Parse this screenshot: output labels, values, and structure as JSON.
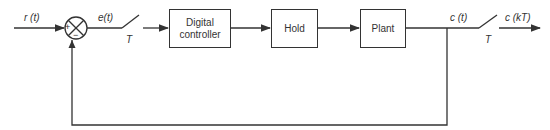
{
  "diagram": {
    "blocks": [
      {
        "id": "controller",
        "line1": "Digital",
        "line2": "controller"
      },
      {
        "id": "hold",
        "label": "Hold"
      },
      {
        "id": "plant",
        "label": "Plant"
      }
    ],
    "signals": {
      "input": "r (t)",
      "error": "e(t)",
      "output": "c (t)",
      "sampled_output": "c (kT)"
    },
    "samplers": {
      "error_sampler": "T",
      "output_sampler": "T"
    },
    "summing_junction": {
      "plus_sign": "+",
      "minus_sign": "−"
    }
  }
}
